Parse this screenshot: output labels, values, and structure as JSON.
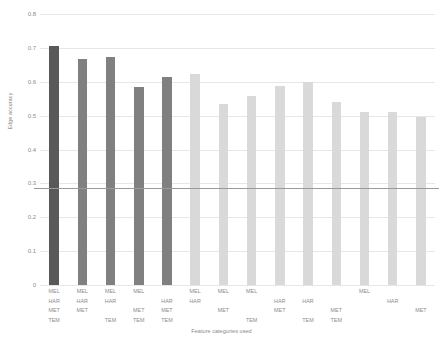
{
  "chart_data": {
    "type": "bar",
    "title": "",
    "xlabel": "Feature categories used",
    "ylabel": "Edge accuracy",
    "ylim": [
      0,
      0.8
    ],
    "ytick_labels": [
      "0",
      "0.1",
      "0.2",
      "0.3",
      "0.4",
      "0.5",
      "0.6",
      "0.7",
      "0.8"
    ],
    "ytick_values": [
      0,
      0.1,
      0.2,
      0.3,
      0.4,
      0.5,
      0.6,
      0.7,
      0.8
    ],
    "grid": true,
    "legend": "none",
    "feature_rows": [
      "MEL",
      "HAR",
      "MET",
      "TEM"
    ],
    "reference_line": {
      "value": 0.285,
      "color": "#9a9a9a"
    },
    "colors": {
      "group_four": "#595959",
      "group_three": "#808080",
      "group_two": "#d9d9d9",
      "gridline": "#e6e6e6",
      "text": "#8c8c8c"
    },
    "categories": [
      "MEL HAR MET TEM",
      "MEL HAR MET",
      "MEL HAR TEM",
      "MEL MET TEM",
      "HAR MET TEM",
      "MEL HAR",
      "MEL MET",
      "MEL TEM",
      "HAR MET",
      "HAR TEM",
      "MET TEM",
      "MEL",
      "HAR",
      "MET"
    ],
    "bars": [
      {
        "features": [
          "MEL",
          "HAR",
          "MET",
          "TEM"
        ],
        "value": 0.705,
        "color": "#595959"
      },
      {
        "features": [
          "MEL",
          "HAR",
          "MET"
        ],
        "value": 0.668,
        "color": "#808080"
      },
      {
        "features": [
          "MEL",
          "HAR",
          "TEM"
        ],
        "value": 0.673,
        "color": "#808080"
      },
      {
        "features": [
          "MEL",
          "MET",
          "TEM"
        ],
        "value": 0.585,
        "color": "#808080"
      },
      {
        "features": [
          "HAR",
          "MET",
          "TEM"
        ],
        "value": 0.613,
        "color": "#808080"
      },
      {
        "features": [
          "MEL",
          "HAR"
        ],
        "value": 0.623,
        "color": "#d9d9d9"
      },
      {
        "features": [
          "MEL",
          "MET"
        ],
        "value": 0.535,
        "color": "#d9d9d9"
      },
      {
        "features": [
          "MEL",
          "TEM"
        ],
        "value": 0.558,
        "color": "#d9d9d9"
      },
      {
        "features": [
          "HAR",
          "MET"
        ],
        "value": 0.588,
        "color": "#d9d9d9"
      },
      {
        "features": [
          "HAR",
          "TEM"
        ],
        "value": 0.6,
        "color": "#d9d9d9"
      },
      {
        "features": [
          "MET",
          "TEM"
        ],
        "value": 0.54,
        "color": "#d9d9d9"
      },
      {
        "features": [
          "MEL"
        ],
        "value": 0.512,
        "color": "#d9d9d9"
      },
      {
        "features": [
          "HAR"
        ],
        "value": 0.512,
        "color": "#d9d9d9"
      },
      {
        "features": [
          "MET"
        ],
        "value": 0.495,
        "color": "#d9d9d9"
      }
    ]
  }
}
